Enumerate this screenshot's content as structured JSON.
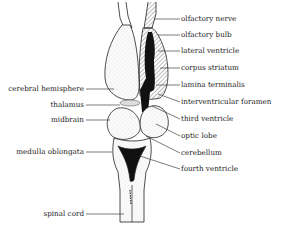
{
  "diagram": {
    "labels_right": [
      {
        "id": "olfactory-nerve",
        "text": "olfactory nerve",
        "y": 16
      },
      {
        "id": "olfactory-bulb",
        "text": "olfactory bulb",
        "y": 32
      },
      {
        "id": "lateral-ventricle",
        "text": "lateral ventricle",
        "y": 48
      },
      {
        "id": "corpus-striatum",
        "text": "corpus striatum",
        "y": 65
      },
      {
        "id": "lamina-terminalis",
        "text": "lamina terminalis",
        "y": 82
      },
      {
        "id": "interventricular-foramen",
        "text": "interventricular foramen",
        "y": 99
      },
      {
        "id": "third-ventricle",
        "text": "third ventricle",
        "y": 116
      },
      {
        "id": "optic-lobe",
        "text": "optic lobe",
        "y": 133
      },
      {
        "id": "cerebellum",
        "text": "cerebellum",
        "y": 150
      },
      {
        "id": "fourth-ventricle",
        "text": "fourth ventricle",
        "y": 166
      }
    ],
    "labels_left": [
      {
        "id": "cerebral-hemisphere",
        "text": "cerebral hemisphere",
        "y": 86
      },
      {
        "id": "thalamus",
        "text": "thalamus",
        "y": 102
      },
      {
        "id": "midbrain",
        "text": "midbrain",
        "y": 117
      },
      {
        "id": "medulla-oblongata",
        "text": "medulla oblongata",
        "y": 149
      },
      {
        "id": "spinal-cord",
        "text": "spinal cord",
        "y": 211
      }
    ]
  }
}
